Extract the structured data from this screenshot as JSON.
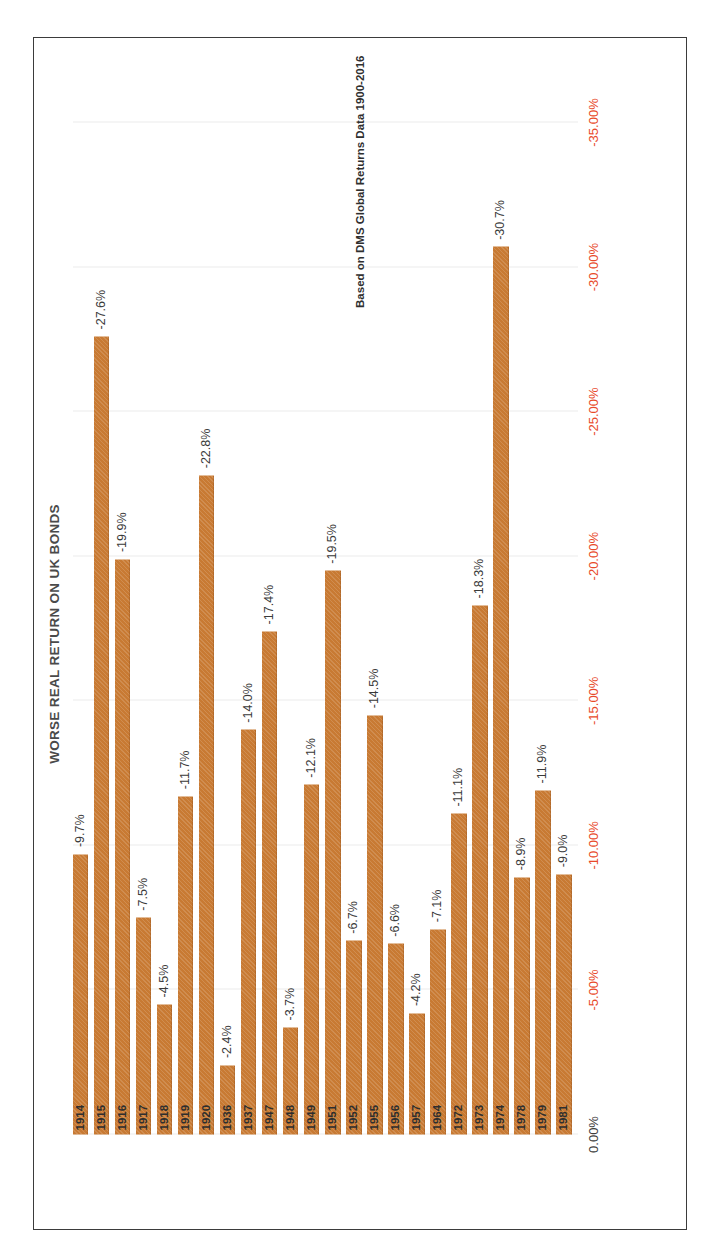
{
  "page": {
    "title": "WORSE REAL RETURN ON UK BONDS",
    "credit": "Based on DMS Global Returns Data 1900-2016"
  },
  "style": {
    "bar_color": "#C87A33",
    "negative_tick_color": "#E8492A",
    "zero_tick_color": "#3D3D3D",
    "title_color": "#4A4A4A",
    "gridline_color": "#ECECEC",
    "frame_color": "#3B3B3B",
    "background": "#FFFFFF"
  },
  "chart_data": {
    "type": "bar",
    "orientation": "horizontal",
    "title": "WORSE REAL RETURN ON UK BONDS",
    "xlabel": "",
    "ylabel": "",
    "xlim": [
      0,
      -35
    ],
    "grid": true,
    "legend": "none",
    "tick_labels": [
      "0.00%",
      "-5.00%",
      "-10.00%",
      "-15.00%",
      "-20.00%",
      "-25.00%",
      "-30.00%",
      "-35.00%"
    ],
    "tick_values": [
      0,
      -5,
      -10,
      -15,
      -20,
      -25,
      -30,
      -35
    ],
    "categories": [
      "1914",
      "1915",
      "1916",
      "1917",
      "1918",
      "1919",
      "1920",
      "1936",
      "1937",
      "1947",
      "1948",
      "1949",
      "1951",
      "1952",
      "1955",
      "1956",
      "1957",
      "1964",
      "1972",
      "1973",
      "1974",
      "1978",
      "1979",
      "1981"
    ],
    "values": [
      -9.7,
      -27.6,
      -19.9,
      -7.5,
      -4.5,
      -11.7,
      -22.8,
      -2.4,
      -14.0,
      -17.4,
      -3.7,
      -12.1,
      -19.5,
      -6.7,
      -14.5,
      -6.6,
      -4.2,
      -7.1,
      -11.1,
      -18.3,
      -30.7,
      -8.9,
      -11.9,
      -9.0
    ],
    "data_labels": [
      "-9.7%",
      "-27.6%",
      "-19.9%",
      "-7.5%",
      "-4.5%",
      "-11.7%",
      "-22.8%",
      "-2.4%",
      "-14.0%",
      "-17.4%",
      "-3.7%",
      "-12.1%",
      "-19.5%",
      "-6.7%",
      "-14.5%",
      "-6.6%",
      "-4.2%",
      "-7.1%",
      "-11.1%",
      "-18.3%",
      "-30.7%",
      "-8.9%",
      "-11.9%",
      "-9.0%"
    ]
  }
}
